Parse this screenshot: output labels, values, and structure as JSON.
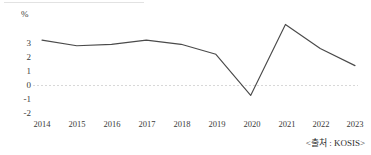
{
  "chart_data": {
    "type": "line",
    "title": "",
    "subtitle": "",
    "xlabel": "",
    "ylabel": "%",
    "unit_label": "%",
    "categories": [
      "2014",
      "2015",
      "2016",
      "2017",
      "2018",
      "2019",
      "2020",
      "2021",
      "2022",
      "2023"
    ],
    "x": [
      2014,
      2015,
      2016,
      2017,
      2018,
      2019,
      2020,
      2021,
      2022,
      2023
    ],
    "values": [
      3.2,
      2.8,
      2.9,
      3.2,
      2.9,
      2.2,
      -0.7,
      4.3,
      2.6,
      1.4
    ],
    "series": [
      {
        "name": "",
        "values": [
          3.2,
          2.8,
          2.9,
          3.2,
          2.9,
          2.2,
          -0.7,
          4.3,
          2.6,
          1.4
        ]
      }
    ],
    "ytick_labels": [
      "3",
      "2",
      "1",
      "0",
      "-1",
      "-2"
    ],
    "ytick_values": [
      3,
      2,
      1,
      0,
      -1,
      -2
    ],
    "ylim": [
      -2,
      5
    ],
    "xlim": [
      2014,
      2023
    ],
    "grid": false,
    "zero_line": true,
    "legend": false,
    "legend_position": "none",
    "line_color": "#4a4a4a",
    "zero_line_color": "#d8d8d8",
    "markers": false
  },
  "source": {
    "text": "<출처 : KOSIS>",
    "label": "KOSIS"
  },
  "axis": {
    "unit": "%",
    "y_labels": [
      "3",
      "2",
      "1",
      "0",
      "-1",
      "-2"
    ],
    "x_labels": [
      "2014",
      "2015",
      "2016",
      "2017",
      "2018",
      "2019",
      "2020",
      "2021",
      "2022",
      "2023"
    ]
  }
}
